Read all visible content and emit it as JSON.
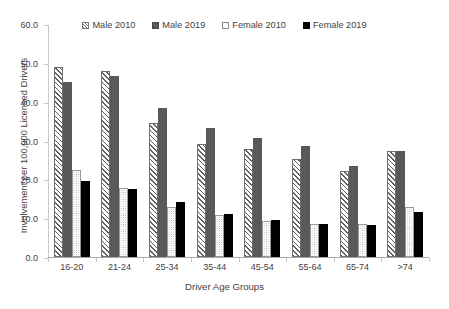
{
  "chart_data": {
    "type": "bar",
    "title": "",
    "xlabel": "Driver Age Groups",
    "ylabel": "Involvement per 100,000 Licensed Drivers",
    "categories": [
      "16-20",
      "21-24",
      "25-34",
      "35-44",
      "45-54",
      "55-64",
      "65-74",
      ">74"
    ],
    "series": [
      {
        "name": "Male 2010",
        "pattern": "diagonal-hatch",
        "color": "#ffffff",
        "values": [
          49.0,
          48.0,
          34.6,
          29.2,
          27.8,
          25.2,
          22.2,
          27.2
        ]
      },
      {
        "name": "Male 2019",
        "pattern": "solid-gray",
        "color": "#595959",
        "values": [
          45.1,
          46.7,
          38.3,
          33.1,
          30.6,
          28.7,
          23.4,
          27.3
        ]
      },
      {
        "name": "Female 2010",
        "pattern": "dotted",
        "color": "#fcfcfc",
        "values": [
          22.4,
          17.8,
          12.8,
          10.7,
          9.3,
          8.4,
          8.4,
          12.8
        ]
      },
      {
        "name": "Female 2019",
        "pattern": "solid-black",
        "color": "#000000",
        "values": [
          19.6,
          17.5,
          14.1,
          11.1,
          9.5,
          8.4,
          8.2,
          11.5
        ]
      }
    ],
    "ylim": [
      0.0,
      60.0
    ],
    "ytick_step": 10.0,
    "yticks": [
      "0.0",
      "10.0",
      "20.0",
      "30.0",
      "40.0",
      "50.0",
      "60.0"
    ],
    "grid": false,
    "legend_position": "top-center"
  },
  "legend": {
    "items": [
      {
        "label": "Male 2010"
      },
      {
        "label": "Male 2019"
      },
      {
        "label": "Female 2010"
      },
      {
        "label": "Female 2019"
      }
    ]
  }
}
